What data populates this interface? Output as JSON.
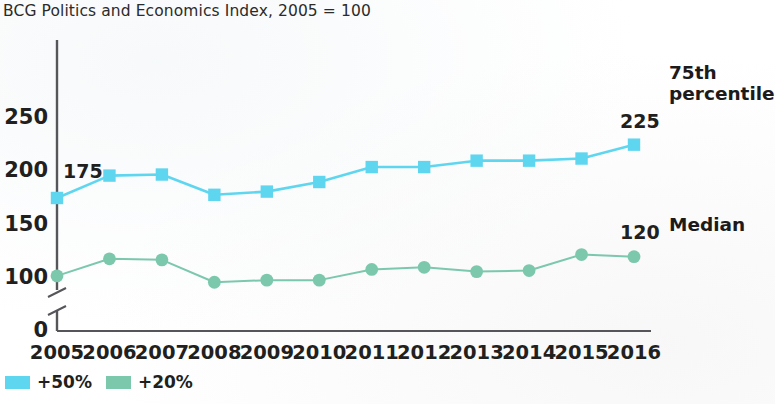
{
  "chart_data": {
    "type": "line",
    "title": "BCG Politics and Economics Index, 2005 = 100",
    "xlabel": "",
    "ylabel": "",
    "categories": [
      "2005",
      "2006",
      "2007",
      "2008",
      "2009",
      "2010",
      "2011",
      "2012",
      "2013",
      "2014",
      "2015",
      "2016"
    ],
    "yticks": [
      "0",
      "100",
      "150",
      "200",
      "250"
    ],
    "ylim": [
      0,
      250
    ],
    "grid": false,
    "axis_break": true,
    "axis_break_between": [
      0,
      100
    ],
    "legend_position": "bottom-left",
    "series": [
      {
        "name": "+50%",
        "annotation": "75th\npercentile",
        "annotation_line1": "75th",
        "annotation_line2": "percentile",
        "color": "#5FD6F0",
        "marker": "square",
        "start_label": "175",
        "end_label": "225",
        "values": [
          175,
          196,
          197,
          178,
          181,
          190,
          204,
          204,
          210,
          210,
          212,
          225
        ]
      },
      {
        "name": "+20%",
        "annotation": "Median",
        "annotation_line1": "Median",
        "annotation_line2": "",
        "color": "#7BC8AD",
        "marker": "circle",
        "start_label": "",
        "end_label": "120",
        "values": [
          102,
          118,
          117,
          96,
          98,
          98,
          108,
          110,
          106,
          107,
          122,
          120
        ]
      }
    ],
    "legend": [
      {
        "label": "+50%",
        "color": "#5FD6F0"
      },
      {
        "label": "+20%",
        "color": "#7BC8AD"
      }
    ],
    "axis_color": "#55555a"
  }
}
